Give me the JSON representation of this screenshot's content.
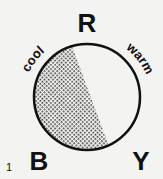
{
  "figure": {
    "number": "1",
    "vertices": {
      "top": "R",
      "bottom_left": "B",
      "bottom_right": "Y"
    },
    "arc_labels": {
      "left": "cool",
      "right": "warm"
    },
    "colors": {
      "ink": "#111111",
      "background": "#f3f3f1"
    }
  }
}
